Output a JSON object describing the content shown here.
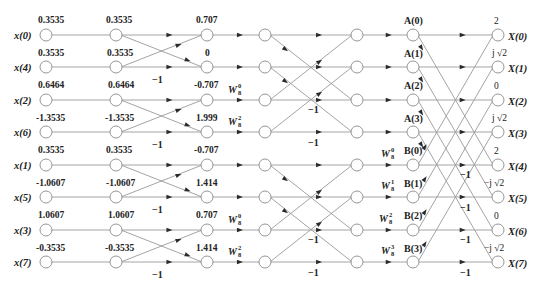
{
  "diagram": {
    "type": "8-point radix-2 DIT FFT butterfly flow graph",
    "inputs": [
      "x(0)",
      "x(4)",
      "x(2)",
      "x(6)",
      "x(1)",
      "x(5)",
      "x(3)",
      "x(7)"
    ],
    "input_values": [
      "0.3535",
      "0.3535",
      "0.6464",
      "-1.3535",
      "0.3535",
      "-1.0607",
      "1.0607",
      "-0.3535"
    ],
    "stage1_values": [
      "0.3535",
      "0.3535",
      "0.6464",
      "-1.3535",
      "0.3535",
      "-1.0607",
      "1.0607",
      "-0.3535"
    ],
    "stage2_values": [
      "0.707",
      "0",
      "-0.707",
      "1.999",
      "-0.707",
      "1.414",
      "0.707",
      "1.414"
    ],
    "stage2_twiddles": [
      {
        "row": 2,
        "base": "W",
        "sup": "0",
        "sub": "8"
      },
      {
        "row": 3,
        "base": "W",
        "sup": "2",
        "sub": "8"
      },
      {
        "row": 6,
        "base": "W",
        "sup": "0",
        "sub": "8"
      },
      {
        "row": 7,
        "base": "W",
        "sup": "2",
        "sub": "8"
      }
    ],
    "intermediate_labels": [
      "A(0)",
      "A(1)",
      "A(2)",
      "A(3)",
      "B(0)",
      "B(1)",
      "B(2)",
      "B(3)"
    ],
    "final_twiddles": [
      {
        "row": 4,
        "base": "W",
        "sup": "0",
        "sub": "8"
      },
      {
        "row": 5,
        "base": "W",
        "sup": "1",
        "sub": "8"
      },
      {
        "row": 6,
        "base": "W",
        "sup": "2",
        "sub": "8"
      },
      {
        "row": 7,
        "base": "W",
        "sup": "3",
        "sub": "8"
      }
    ],
    "outputs": [
      "X(0)",
      "X(1)",
      "X(2)",
      "X(3)",
      "X(4)",
      "X(5)",
      "X(6)",
      "X(7)"
    ],
    "output_values": [
      "2",
      "j √2",
      "0",
      "j √2",
      "2",
      "−j √2",
      "0",
      "−j √2"
    ],
    "negation_label": "−1"
  }
}
